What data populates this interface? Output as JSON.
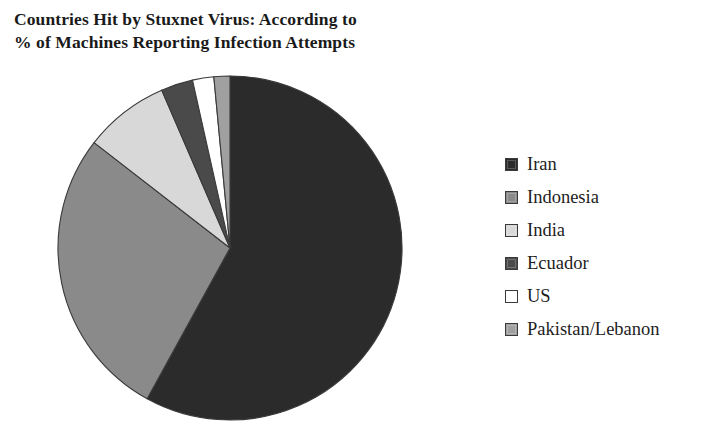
{
  "title": {
    "line1": "Countries Hit by Stuxnet Virus: According to",
    "line2": "% of Machines Reporting Infection Attempts"
  },
  "legend": {
    "position": "right",
    "items": [
      {
        "label": "Iran",
        "color": "#2b2b2b",
        "swatch_name": "legend-swatch-iran"
      },
      {
        "label": "Indonesia",
        "color": "#8a8a8a",
        "swatch_name": "legend-swatch-indonesia"
      },
      {
        "label": "India",
        "color": "#d8d8d8",
        "swatch_name": "legend-swatch-india"
      },
      {
        "label": "Ecuador",
        "color": "#4a4a4a",
        "swatch_name": "legend-swatch-ecuador"
      },
      {
        "label": "US",
        "color": "#ffffff",
        "swatch_name": "legend-swatch-us"
      },
      {
        "label": "Pakistan/Lebanon",
        "color": "#a0a0a0",
        "swatch_name": "legend-swatch-pakistan-lebanon"
      }
    ]
  },
  "chart_data": {
    "type": "pie",
    "title": "Countries Hit by Stuxnet Virus: According to % of Machines Reporting Infection Attempts",
    "unit": "% of machines reporting infection attempts",
    "start_angle_deg": 0,
    "direction": "clockwise",
    "legend_position": "right",
    "labels": [
      "Iran",
      "Indonesia",
      "India",
      "Ecuador",
      "US",
      "Pakistan/Lebanon"
    ],
    "values": [
      58.0,
      27.5,
      8.0,
      3.0,
      2.0,
      1.5
    ],
    "colors": [
      "#2b2b2b",
      "#8a8a8a",
      "#d8d8d8",
      "#4a4a4a",
      "#ffffff",
      "#a0a0a0"
    ],
    "slices": [
      {
        "label": "Iran",
        "value": 58.0,
        "color": "#2b2b2b"
      },
      {
        "label": "Indonesia",
        "value": 27.5,
        "color": "#8a8a8a"
      },
      {
        "label": "India",
        "value": 8.0,
        "color": "#d8d8d8"
      },
      {
        "label": "Ecuador",
        "value": 3.0,
        "color": "#4a4a4a"
      },
      {
        "label": "US",
        "value": 2.0,
        "color": "#ffffff"
      },
      {
        "label": "Pakistan/Lebanon",
        "value": 1.5,
        "color": "#a0a0a0"
      }
    ]
  }
}
